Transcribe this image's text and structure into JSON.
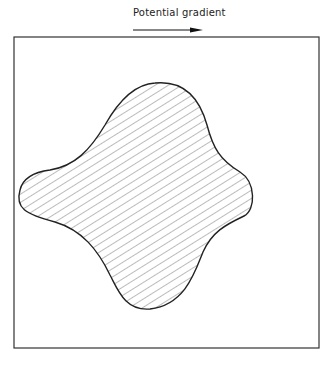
{
  "diagram": {
    "label": "Potential gradient",
    "arrow_direction": "right",
    "frame": {
      "x": 14,
      "y": 37,
      "width": 305,
      "height": 311
    },
    "shape": {
      "type": "four-lobed hatched region",
      "fill": "diagonal-hatch",
      "stroke": "#222222",
      "hatch_color": "#777777"
    }
  }
}
